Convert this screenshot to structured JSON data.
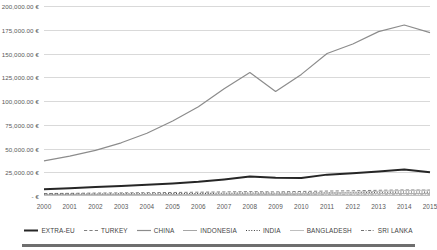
{
  "chart_data": {
    "type": "line",
    "title": "",
    "subtitle": "",
    "xlabel": "",
    "ylabel": "",
    "currency_symbol": "€",
    "grid": true,
    "legend_position": "bottom",
    "x": [
      2000,
      2001,
      2002,
      2003,
      2004,
      2005,
      2006,
      2007,
      2008,
      2009,
      2010,
      2011,
      2012,
      2013,
      2014,
      2015
    ],
    "categories": [
      "2000",
      "2001",
      "2002",
      "2003",
      "2004",
      "2005",
      "2006",
      "2007",
      "2008",
      "2009",
      "2010",
      "2011",
      "2012",
      "2013",
      "2014",
      "2015"
    ],
    "ylim": [
      0,
      200000
    ],
    "yticks": [
      0,
      25000,
      50000,
      75000,
      100000,
      125000,
      150000,
      175000,
      200000
    ],
    "ytick_labels": [
      "- €",
      "25,000.00 €",
      "50,000.00 €",
      "75,000.00 €",
      "100,000.00 €",
      "125,000.00 €",
      "150,000.00 €",
      "175,000.00 €",
      "200,000.00 €"
    ],
    "series": [
      {
        "name": "EXTRA-EU",
        "color": "#262626",
        "style": "solid",
        "width": 2.0,
        "values": [
          7000,
          8200,
          9400,
          10500,
          11800,
          13200,
          15000,
          17500,
          20500,
          19200,
          19000,
          22500,
          24000,
          25800,
          27800,
          25000
        ]
      },
      {
        "name": "TURKEY",
        "color": "#808080",
        "style": "dashed",
        "width": 1.0,
        "values": [
          2600,
          2800,
          3100,
          3300,
          3500,
          3700,
          4000,
          4300,
          4600,
          4300,
          4800,
          5200,
          5500,
          6000,
          6400,
          6200
        ]
      },
      {
        "name": "CHINA",
        "color": "#8c8c8c",
        "style": "solid",
        "width": 1.2,
        "values": [
          37000,
          42000,
          48000,
          56000,
          66000,
          79000,
          94000,
          113000,
          130000,
          110000,
          128000,
          150000,
          160000,
          173000,
          180000,
          172000
        ]
      },
      {
        "name": "INDONESIA",
        "color": "#a6a6a6",
        "style": "solid",
        "width": 1.0,
        "values": [
          1300,
          1350,
          1400,
          1450,
          1500,
          1550,
          1650,
          1750,
          1900,
          1800,
          1950,
          2100,
          2200,
          2350,
          2500,
          2450
        ]
      },
      {
        "name": "INDIA",
        "color": "#404040",
        "style": "dotted",
        "width": 1.1,
        "values": [
          1900,
          2000,
          2100,
          2200,
          2350,
          2500,
          2700,
          2900,
          3100,
          2950,
          3200,
          3500,
          3700,
          3900,
          4200,
          4100
        ]
      },
      {
        "name": "BANGLADESH",
        "color": "#bfbfbf",
        "style": "solid",
        "width": 1.0,
        "values": [
          1000,
          1050,
          1120,
          1200,
          1300,
          1400,
          1600,
          1850,
          2150,
          2200,
          2600,
          3300,
          4000,
          4900,
          5800,
          6100
        ]
      },
      {
        "name": "SRI LANKA",
        "color": "#737373",
        "style": "dashdot",
        "width": 1.0,
        "values": [
          600,
          620,
          650,
          660,
          680,
          700,
          720,
          760,
          800,
          760,
          820,
          880,
          900,
          950,
          1000,
          980
        ]
      }
    ]
  }
}
